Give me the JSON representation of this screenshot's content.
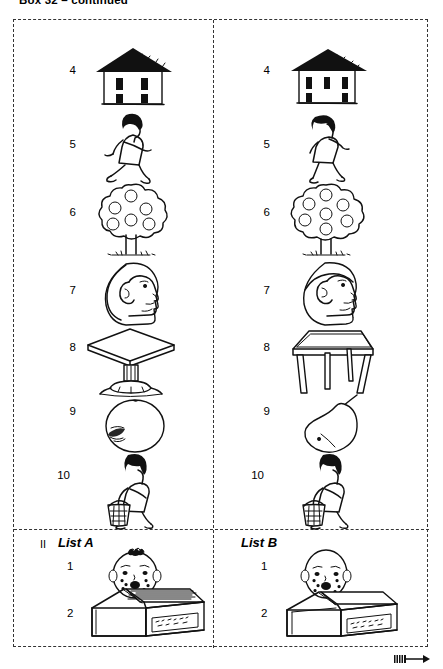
{
  "page": {
    "title": "Box 32 – continued",
    "continuation_arrow": "arrow-right"
  },
  "plate": {
    "columns": [
      {
        "id": "list-a-top",
        "items": [
          {
            "number": "4",
            "picture": "house-two-storey-four-windows"
          },
          {
            "number": "5",
            "picture": "woman-running"
          },
          {
            "number": "6",
            "picture": "fruit-tree-six-apples"
          },
          {
            "number": "7",
            "picture": "head-profile-short-hair"
          },
          {
            "number": "8",
            "picture": "pedestal-table-square-top"
          },
          {
            "number": "9",
            "picture": "apple-round-shaded"
          },
          {
            "number": "10",
            "picture": "woman-walking-with-basket"
          }
        ]
      },
      {
        "id": "list-b-top",
        "items": [
          {
            "number": "4",
            "picture": "house-two-storey-five-windows"
          },
          {
            "number": "5",
            "picture": "woman-walking"
          },
          {
            "number": "6",
            "picture": "fruit-tree-seven-apples"
          },
          {
            "number": "7",
            "picture": "head-profile-cap-hair"
          },
          {
            "number": "8",
            "picture": "table-four-legs"
          },
          {
            "number": "9",
            "picture": "pear-plain"
          },
          {
            "number": "10",
            "picture": "woman-walking-with-basket"
          }
        ]
      }
    ],
    "section_two": {
      "roman_numeral": "II",
      "panels": [
        {
          "label": "List A",
          "items": [
            {
              "number": "1",
              "picture": "baby-face-with-hair"
            },
            {
              "number": "2",
              "picture": "matchbox-open-full-of-matches"
            }
          ]
        },
        {
          "label": "List B",
          "items": [
            {
              "number": "1",
              "picture": "baby-face-bald"
            },
            {
              "number": "2",
              "picture": "matchbox-open-empty"
            }
          ]
        }
      ]
    }
  },
  "colors": {
    "ink": "#111111",
    "paper": "#ffffff",
    "frame_dash": "#333333"
  }
}
